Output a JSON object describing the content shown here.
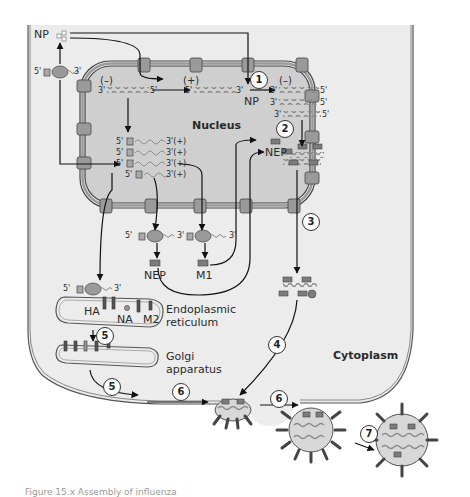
{
  "figure": {
    "caption": "Figure 15.x Assembly of influenza"
  },
  "regions": {
    "nucleus": "Nucleus",
    "cytoplasm": "Cytoplasm",
    "er_line1": "Endoplasmic",
    "er_line2": "reticulum",
    "golgi_line1": "Golgi",
    "golgi_line2": "apparatus"
  },
  "proteins": {
    "np_top": "NP",
    "np_inner": "NP",
    "nep_inner": "NEP",
    "nep_cyto": "NEP",
    "m1_cyto": "M1",
    "ha": "HA",
    "na": "NA",
    "m2": "M2"
  },
  "rna": {
    "neg_label": "(–)",
    "pos_label": "(+)",
    "neg_template": {
      "left": "3'",
      "right": "5'"
    },
    "pos_template": {
      "left": "5'",
      "right": "3'"
    },
    "vrna_copies": [
      {
        "left": "3'",
        "right": "5'"
      },
      {
        "left": "3'",
        "right": "5'"
      },
      {
        "left": "3'",
        "right": "5'"
      }
    ],
    "mrnas": [
      {
        "left": "5'",
        "right": "3'(+)"
      },
      {
        "left": "5'",
        "right": "3'(+)"
      },
      {
        "left": "5'",
        "right": "3'(+)"
      },
      {
        "left": "5'",
        "right": "3'(+)"
      }
    ],
    "ribosome_top": {
      "left": "5'",
      "right": "3'"
    },
    "ribosome_nep": {
      "left": "5'",
      "right": "3'"
    },
    "ribosome_m1": {
      "left": "5'",
      "right": "3'"
    },
    "ribosome_er": {
      "left": "5'",
      "right": "3'"
    }
  },
  "steps": [
    "1",
    "2",
    "3",
    "4",
    "5",
    "5",
    "6",
    "6",
    "7"
  ],
  "colors": {
    "cytoplasm": "#ececec",
    "nucleus": "#cfcfcf",
    "membrane": "#555555",
    "pore": "#9a9a9a",
    "rna": "#8a8a8a",
    "protein": "#7c7c7c",
    "arrow": "#111111"
  }
}
